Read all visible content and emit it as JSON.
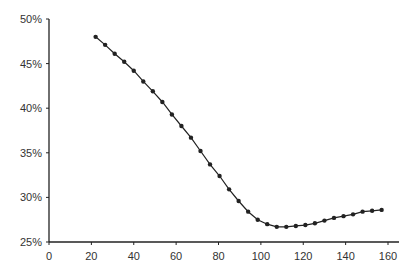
{
  "chart_data": {
    "type": "line",
    "title": "",
    "xlabel": "",
    "ylabel": "",
    "xlim": [
      0,
      160
    ],
    "ylim": [
      25,
      50
    ],
    "x_ticks": [
      0,
      20,
      40,
      60,
      80,
      100,
      120,
      140,
      160
    ],
    "y_ticks": [
      "25%",
      "30%",
      "35%",
      "40%",
      "45%",
      "50%"
    ],
    "y_tick_values": [
      25,
      30,
      35,
      40,
      45,
      50
    ],
    "grid": false,
    "legend": null,
    "series": [
      {
        "name": "series",
        "color": "#222222",
        "marker": "circle",
        "x": [
          22,
          26.5,
          31,
          35.5,
          40,
          44.5,
          49,
          53.5,
          58,
          62.5,
          67,
          71.5,
          76,
          80.5,
          85,
          89.5,
          94,
          98.5,
          103,
          107.5,
          112,
          116.5,
          121,
          125.5,
          130,
          134.5,
          139,
          143.5,
          148,
          152.5,
          157
        ],
        "values": [
          48.0,
          47.1,
          46.1,
          45.2,
          44.2,
          43.0,
          41.9,
          40.7,
          39.3,
          38.0,
          36.7,
          35.2,
          33.7,
          32.4,
          30.9,
          29.6,
          28.4,
          27.5,
          27.0,
          26.7,
          26.7,
          26.8,
          26.9,
          27.1,
          27.4,
          27.7,
          27.9,
          28.1,
          28.4,
          28.5,
          28.6
        ]
      }
    ]
  }
}
